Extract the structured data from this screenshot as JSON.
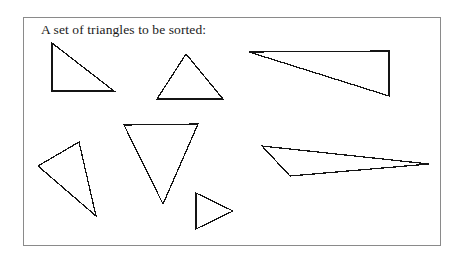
{
  "figure": {
    "caption": "A set of triangles to be sorted:",
    "background_color": "#ffffff",
    "frame_color": "#8a8a8a",
    "stroke_color": "#141414",
    "frame": {
      "x": 23,
      "y": 17,
      "width": 418,
      "height": 229
    }
  },
  "chart_data": {
    "type": "diagram",
    "title": "A set of triangles to be sorted:",
    "xlabel": "",
    "ylabel": "",
    "shape_count": 7,
    "shapes": [
      {
        "name": "triangle-1-right-tall",
        "description": "right triangle, vertical left leg, apex top-left",
        "points": "52,43 52,91 114,91"
      },
      {
        "name": "triangle-2-equilateral",
        "description": "near-equilateral triangle pointing up",
        "points": "186,54 157,99 223,99"
      },
      {
        "name": "triangle-3-thin-wide",
        "description": "thin wide right triangle, horizontal top edge",
        "points": "249,52 389,51 389,96"
      },
      {
        "name": "triangle-4-tilted-left",
        "description": "tilted scalene triangle lower-left",
        "points": "38,166 79,142 96,216"
      },
      {
        "name": "triangle-5-pointing-down",
        "description": "triangle pointing downward, horizontal top edge",
        "points": "124,125 198,124 163,204"
      },
      {
        "name": "triangle-6-sliver-right",
        "description": "very thin elongated sliver pointing right",
        "points": "262,146 429,164 290,176"
      },
      {
        "name": "triangle-7-small-right-pointing",
        "description": "small triangle pointing right, vertical left edge",
        "points": "196,193 196,229 233,211"
      }
    ]
  }
}
